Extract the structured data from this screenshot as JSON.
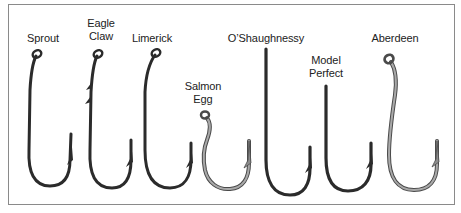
{
  "diagram": {
    "colors": {
      "border": "#8a8a8a",
      "dark_hook": "#2b2b2b",
      "light_hook_fill": "#a9a9a9",
      "light_hook_outline": "#4a4a4a",
      "label": "#222222"
    },
    "hooks": [
      {
        "id": "sprout",
        "label_lines": [
          "Sprout"
        ],
        "style": "dark",
        "eye": "ringed"
      },
      {
        "id": "eagle-claw",
        "label_lines": [
          "Eagle",
          "Claw"
        ],
        "style": "dark",
        "eye": "ringed",
        "shank_barbs": 2
      },
      {
        "id": "limerick",
        "label_lines": [
          "Limerick"
        ],
        "style": "dark",
        "eye": "ringed"
      },
      {
        "id": "salmon-egg",
        "label_lines": [
          "Salmon",
          "Egg"
        ],
        "style": "light",
        "eye": "ringed"
      },
      {
        "id": "oshaughnessy",
        "label_lines": [
          "O’Shaughnessy"
        ],
        "style": "dark",
        "eye": "none"
      },
      {
        "id": "model-perfect",
        "label_lines": [
          "Model",
          "Perfect"
        ],
        "style": "dark",
        "eye": "none"
      },
      {
        "id": "aberdeen",
        "label_lines": [
          "Aberdeen"
        ],
        "style": "light",
        "eye": "ringed"
      }
    ]
  }
}
